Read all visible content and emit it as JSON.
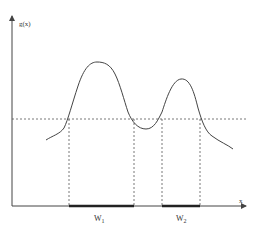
{
  "diagram": {
    "y_axis_label": "g(x)",
    "x_axis_label": "x",
    "windows": [
      {
        "label_main": "W",
        "label_sub": "1",
        "x_start": 69,
        "x_end": 134
      },
      {
        "label_main": "W",
        "label_sub": "2",
        "x_start": 162,
        "x_end": 200
      }
    ],
    "threshold": {
      "style": "dashed",
      "y": 119
    },
    "curve": {
      "description": "bimodal function g(x) with two peaks above threshold",
      "peaks": [
        {
          "x": 97,
          "y": 62
        },
        {
          "x": 181,
          "y": 79
        }
      ],
      "valley": {
        "x": 147,
        "y": 129
      }
    },
    "colors": {
      "line": "#444444",
      "dashed": "#555555",
      "window_bar": "#222222",
      "background": "#ffffff"
    }
  }
}
